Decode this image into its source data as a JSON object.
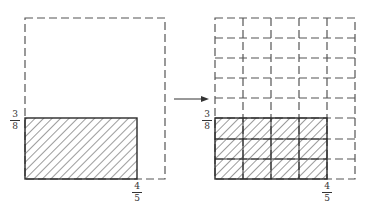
{
  "diagram": {
    "colors": {
      "stroke": "#3a3a3a",
      "dash": "#555555",
      "background": "#ffffff"
    },
    "left": {
      "outer_square": {
        "style": "dashed",
        "represents": "unit square (1 x 1)"
      },
      "shaded_rect": {
        "width_fraction": "4/5",
        "height_fraction": "3/8",
        "pattern": "diagonal hatch"
      },
      "labels": {
        "height": {
          "num": "3",
          "den": "8"
        },
        "width": {
          "num": "4",
          "den": "5"
        }
      }
    },
    "arrow": {
      "direction": "right",
      "icon": "arrow-right-icon"
    },
    "right": {
      "grid": {
        "columns": 5,
        "rows": 8,
        "style": "dashed"
      },
      "shaded_cells": {
        "columns": 4,
        "rows": 3,
        "count": 12,
        "total": 40
      },
      "labels": {
        "height": {
          "num": "3",
          "den": "8"
        },
        "width": {
          "num": "4",
          "den": "5"
        }
      }
    }
  }
}
